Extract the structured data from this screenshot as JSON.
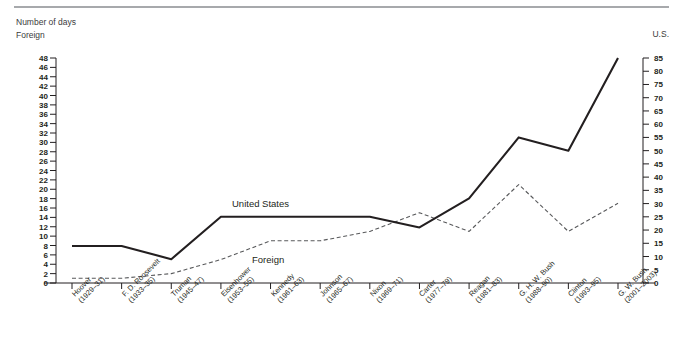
{
  "header": {
    "line1": "Number of days",
    "line2": "Foreign"
  },
  "right_axis_title": "U.S.",
  "series_labels": {
    "us": "United States",
    "foreign": "Foreign"
  },
  "chart_data": {
    "type": "line",
    "title": "Number of days",
    "xlabel": "",
    "ylabel": "Foreign",
    "y2label": "U.S.",
    "ylim": [
      0,
      48
    ],
    "y2lim": [
      0,
      85
    ],
    "yticks": [
      0,
      2,
      4,
      6,
      8,
      10,
      12,
      14,
      16,
      18,
      20,
      22,
      24,
      26,
      28,
      30,
      32,
      34,
      36,
      38,
      40,
      42,
      44,
      46,
      48
    ],
    "y2ticks": [
      0,
      5,
      10,
      15,
      20,
      25,
      30,
      35,
      40,
      45,
      50,
      55,
      60,
      65,
      70,
      75,
      80,
      85
    ],
    "grid": false,
    "legend": "inline-annotations",
    "categories": [
      "Hoover (1929–31)",
      "F. D. Roosevelt (1933–35)",
      "Truman (1945–47)",
      "Eisenhower (1953–55)",
      "Kennedy (1961–63)",
      "Johnson (1965–67)",
      "Nixon (1969–71)",
      "Carter (1977–79)",
      "Reagan (1981–83)",
      "G. H. W. Bush (1988–90)",
      "Clinton (1993–95)",
      "G. W. Bush (2001–2003)"
    ],
    "category_lines": [
      [
        "Hoover",
        "(1929–31)"
      ],
      [
        "F. D. Roosevelt",
        "(1933–35)"
      ],
      [
        "Truman",
        "(1945–47)"
      ],
      [
        "Eisenhower",
        "(1953–55)"
      ],
      [
        "Kennedy",
        "(1961–63)"
      ],
      [
        "Johnson",
        "(1965–67)"
      ],
      [
        "Nixon",
        "(1969–71)"
      ],
      [
        "Carter",
        "(1977–79)"
      ],
      [
        "Reagan",
        "(1981–83)"
      ],
      [
        "G. H. W. Bush",
        "(1988–90)"
      ],
      [
        "Clinton",
        "(1993–95)"
      ],
      [
        "G. W. Bush",
        "(2001–2003)"
      ]
    ],
    "series": [
      {
        "name": "United States",
        "axis": "right",
        "style": "solid",
        "color": "#231f20",
        "values_left_scale": [
          8,
          8,
          5,
          14,
          14,
          14,
          14,
          12,
          18,
          31,
          28,
          48
        ],
        "values": [
          14,
          14,
          9,
          25,
          25,
          25,
          25,
          21,
          32,
          55,
          50,
          85
        ]
      },
      {
        "name": "Foreign",
        "axis": "left",
        "style": "dashed",
        "color": "#58595b",
        "values": [
          1,
          1,
          2,
          5,
          9,
          9,
          11,
          15,
          11,
          21,
          11,
          17
        ]
      }
    ]
  },
  "colors": {
    "rule": "#a7a9ac",
    "axis": "#231f20",
    "us_line": "#231f20",
    "foreign_line": "#58595b",
    "text": "#231f20"
  }
}
